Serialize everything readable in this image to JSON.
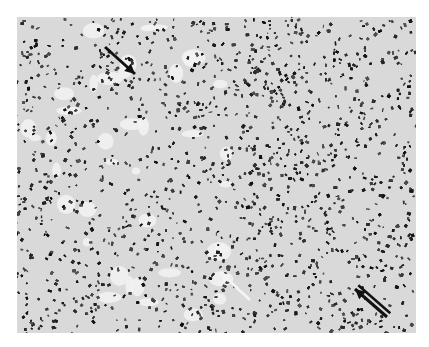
{
  "figure": {
    "type": "histology-micrograph",
    "colormode": "grayscale",
    "frame": {
      "x": 17,
      "y": 17,
      "width": 399,
      "height": 316
    },
    "background_color": "#ffffff",
    "tissue_base_color": "#d9d9d9",
    "nuclei_color": "#1e1e1e",
    "regions": [
      {
        "name": "dense-band-center",
        "cx": 250,
        "cy": 140,
        "rx": 55,
        "ry": 130,
        "density": 0.95
      },
      {
        "name": "pale-areas-left",
        "cx": 110,
        "cy": 150,
        "rx": 90,
        "ry": 110,
        "density": 0.45
      },
      {
        "name": "right-field",
        "cx": 340,
        "cy": 170,
        "rx": 80,
        "ry": 150,
        "density": 0.6
      }
    ],
    "annotations": [
      {
        "name": "black-arrow-top-left",
        "color": "#111111",
        "x1": 88,
        "y1": 30,
        "x2": 118,
        "y2": 57,
        "style": "single"
      },
      {
        "name": "white-arrow-center",
        "color": "#f4f4f4",
        "x1": 233,
        "y1": 283,
        "x2": 203,
        "y2": 255,
        "style": "single"
      },
      {
        "name": "black-arrow-bottom-right",
        "color": "#111111",
        "x1": 370,
        "y1": 300,
        "x2": 338,
        "y2": 272,
        "style": "double"
      }
    ]
  }
}
